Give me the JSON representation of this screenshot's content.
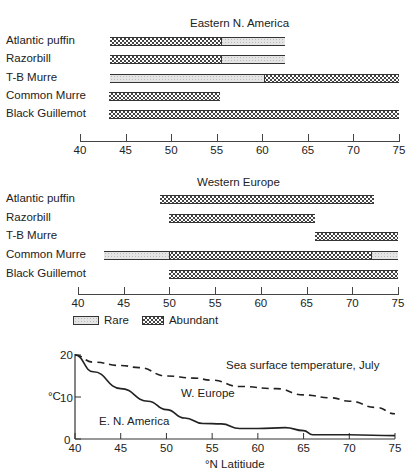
{
  "chart_data": [
    {
      "type": "bar",
      "subtype": "range-bar",
      "title": "Eastern N. America",
      "xlabel": "",
      "xlim": [
        40,
        75
      ],
      "xticks": [
        40,
        45,
        50,
        55,
        60,
        65,
        70,
        75
      ],
      "categories": [
        "Atlantic puffin",
        "Razorbill",
        "T-B Murre",
        "Common Murre",
        "Black Guillemot"
      ],
      "series": [
        {
          "name": "Atlantic puffin",
          "segments": [
            {
              "status": "Abundant",
              "from": 43.3,
              "to": 55.5
            },
            {
              "status": "Rare",
              "from": 55.5,
              "to": 62.5
            }
          ]
        },
        {
          "name": "Razorbill",
          "segments": [
            {
              "status": "Abundant",
              "from": 43.3,
              "to": 55.5
            },
            {
              "status": "Rare",
              "from": 55.5,
              "to": 62.5
            }
          ]
        },
        {
          "name": "T-B Murre",
          "segments": [
            {
              "status": "Rare",
              "from": 43.3,
              "to": 60.2
            },
            {
              "status": "Abundant",
              "from": 60.2,
              "to": 75
            }
          ]
        },
        {
          "name": "Common Murre",
          "segments": [
            {
              "status": "Abundant",
              "from": 43.2,
              "to": 55.4
            }
          ]
        },
        {
          "name": "Black Guillemot",
          "segments": [
            {
              "status": "Abundant",
              "from": 43.2,
              "to": 75
            }
          ]
        }
      ]
    },
    {
      "type": "bar",
      "subtype": "range-bar",
      "title": "Western Europe",
      "xlabel": "",
      "xlim": [
        40,
        75
      ],
      "xticks": [
        40,
        45,
        50,
        55,
        60,
        65,
        70,
        75
      ],
      "categories": [
        "Atlantic puffin",
        "Razorbill",
        "T-B Murre",
        "Common Murre",
        "Black Guillemot"
      ],
      "series": [
        {
          "name": "Atlantic puffin",
          "segments": [
            {
              "status": "Abundant",
              "from": 49.0,
              "to": 72.4
            }
          ]
        },
        {
          "name": "Razorbill",
          "segments": [
            {
              "status": "Abundant",
              "from": 50.0,
              "to": 65.9
            }
          ]
        },
        {
          "name": "T-B Murre",
          "segments": [
            {
              "status": "Abundant",
              "from": 65.9,
              "to": 75
            }
          ]
        },
        {
          "name": "Common Murre",
          "segments": [
            {
              "status": "Rare",
              "from": 42.8,
              "to": 49.9
            },
            {
              "status": "Abundant",
              "from": 49.9,
              "to": 72.0
            },
            {
              "status": "Rare",
              "from": 72.0,
              "to": 75
            }
          ]
        },
        {
          "name": "Black Guillemot",
          "segments": [
            {
              "status": "Abundant",
              "from": 49.9,
              "to": 75
            }
          ]
        }
      ],
      "legend": [
        {
          "label": "Rare",
          "pattern": "stippled"
        },
        {
          "label": "Abundant",
          "pattern": "checkered"
        }
      ]
    },
    {
      "type": "line",
      "title": "Sea surface temperature, July",
      "xlabel": "°N Latitiude",
      "ylabel": "°C",
      "xlim": [
        40,
        75
      ],
      "ylim": [
        0,
        20
      ],
      "xticks": [
        40,
        45,
        50,
        55,
        60,
        65,
        70,
        75
      ],
      "yticks": [
        0,
        10,
        20
      ],
      "grid": false,
      "series": [
        {
          "name": "W. Europe",
          "style": "dashed",
          "x": [
            40,
            42,
            45,
            47,
            50,
            53,
            55,
            58,
            62,
            65,
            68,
            70,
            73,
            75
          ],
          "y": [
            20,
            18.3,
            17.5,
            17,
            15,
            14.5,
            14,
            12.5,
            12,
            10.5,
            9.8,
            9,
            7.5,
            6
          ]
        },
        {
          "name": "E. N. America",
          "style": "solid",
          "x": [
            40,
            42,
            45,
            48,
            50,
            52,
            54,
            56,
            58,
            60,
            63,
            65,
            66,
            70,
            75
          ],
          "y": [
            20,
            16,
            12,
            9,
            7,
            5,
            3.7,
            3.6,
            2.5,
            2.5,
            2.7,
            2,
            1,
            1,
            0.8
          ]
        }
      ]
    }
  ],
  "labels": {
    "panel1_title": "Eastern N. America",
    "panel2_title": "Western Europe",
    "species": [
      "Atlantic puffin",
      "Razorbill",
      "T-B Murre",
      "Common Murre",
      "Black Guillemot"
    ],
    "ticks": [
      "40",
      "45",
      "50",
      "55",
      "60",
      "65",
      "70",
      "75"
    ],
    "legend_rare": "Rare",
    "legend_abundant": "Abundant",
    "line_title": "Sea surface temperature, July",
    "line_ylabel": "°C",
    "line_xlabel": "°N Latitiude",
    "line_yticks": [
      "20",
      "10",
      "0"
    ],
    "series_weurope": "W. Europe",
    "series_ena": "E. N. America"
  }
}
